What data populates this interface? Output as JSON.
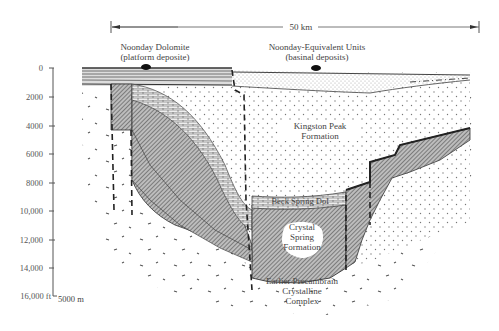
{
  "scale_bar": {
    "label": "50 km"
  },
  "headers": {
    "left": {
      "line1": "Noonday Dolomite",
      "line2": "(platform deposite)"
    },
    "right": {
      "line1": "Noonday-Equivalent Units",
      "line2": "(basinal deposits)"
    }
  },
  "depth_axis": {
    "ticks": [
      "0",
      "2000",
      "4000",
      "6000",
      "8000",
      "10,000",
      "12,000",
      "14,000",
      "16,000 ft"
    ],
    "metric_label": "5000 m"
  },
  "formations": {
    "kingston_peak": {
      "line1": "Kingston Peak",
      "line2": "Formation"
    },
    "beck_spring": {
      "label": "Beck Spring Dol"
    },
    "crystal_spring": {
      "line1": "Crystal",
      "line2": "Spring",
      "line3": "Formation"
    },
    "basement": {
      "line1": "Earlier Precambrain",
      "line2": "Crystalline",
      "line3": "Complex"
    }
  },
  "colors": {
    "line": "#333333",
    "hatch": "#555555",
    "dots": "#777777"
  }
}
